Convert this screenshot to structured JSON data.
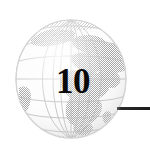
{
  "page": {
    "kind": "chapter-opening-graphic",
    "background_color": "#ffffff",
    "width": 150,
    "height": 155
  },
  "chapter": {
    "number": "10",
    "number_color": "#0a0a0a",
    "rule_color": "#1c1c1c"
  },
  "globe": {
    "icon_name": "globe-icon",
    "view": "Europe and Africa",
    "style": "dithered halftone grayscale",
    "ocean_color": "#fbfbfb",
    "land_color": "#a8a8a8",
    "grid_color": "#b4b4b4",
    "outline_color": "#d2d2d2",
    "graticule": {
      "meridians": 7,
      "parallels": 7
    }
  }
}
